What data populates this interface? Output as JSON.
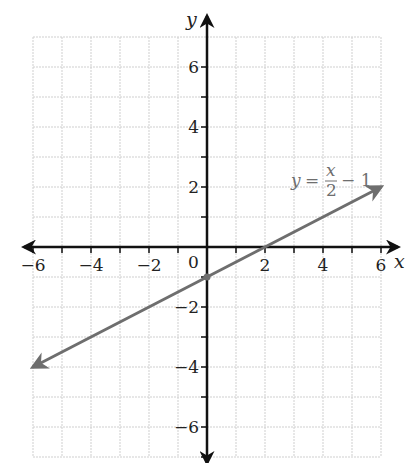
{
  "chart_data": {
    "type": "line",
    "title": "",
    "xlabel": "x",
    "ylabel": "y",
    "xlim": [
      -6,
      6
    ],
    "ylim": [
      -7,
      7
    ],
    "grid": true,
    "x_ticks": [
      -6,
      -5,
      -4,
      -3,
      -2,
      -1,
      0,
      1,
      2,
      3,
      4,
      5,
      6
    ],
    "x_tick_labels": [
      "-6",
      "-4",
      "-2",
      "0",
      "2",
      "4",
      "6"
    ],
    "x_tick_label_values": [
      -6,
      -4,
      -2,
      0,
      2,
      4,
      6
    ],
    "y_ticks": [
      -7,
      -6,
      -5,
      -4,
      -3,
      -2,
      -1,
      1,
      2,
      3,
      4,
      5,
      6
    ],
    "y_tick_labels": [
      "6",
      "4",
      "2",
      "-2",
      "-4",
      "-6"
    ],
    "y_tick_label_values": [
      6,
      4,
      2,
      -2,
      -4,
      -6
    ],
    "series": [
      {
        "name": "y = x/2 - 1",
        "equation": "y = x/2 - 1",
        "color": "#6e6e6e",
        "x": [
          -6,
          0,
          2,
          6
        ],
        "y": [
          -4,
          -1,
          0,
          2
        ],
        "arrows_both_ends": true,
        "marked_point": [
          0,
          -1
        ]
      }
    ],
    "annotations": [
      {
        "text": "y = x/2 − 1",
        "x": 3.5,
        "y": 2.2
      }
    ]
  },
  "labels": {
    "x_axis": "x",
    "y_axis": "y",
    "origin": "0",
    "eq_y": "y",
    "eq_equals": "=",
    "eq_num": "x",
    "eq_den": "2",
    "eq_tail": "− 1"
  },
  "colors": {
    "grid": "#cfcfcf",
    "axis": "#111111",
    "line": "#6e6e6e"
  }
}
